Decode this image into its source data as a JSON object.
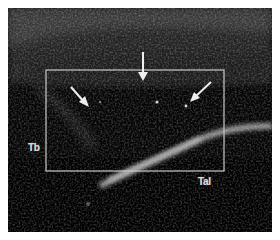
{
  "image": {
    "type": "ultrasound",
    "labels": {
      "left": "Tb",
      "bottom_right": "Tal"
    },
    "roi_box": {
      "x": 38,
      "y": 62,
      "width": 178,
      "height": 101,
      "color": "#c8c8c8"
    },
    "arrows": [
      {
        "from": [
          63,
          79
        ],
        "to": [
          80,
          98
        ]
      },
      {
        "from": [
          135,
          44
        ],
        "to": [
          135,
          72
        ]
      },
      {
        "from": [
          203,
          74
        ],
        "to": [
          183,
          93
        ]
      }
    ],
    "colors": {
      "background": "#050505",
      "annotation": "#e6e6e6",
      "page": "#ffffff"
    }
  }
}
